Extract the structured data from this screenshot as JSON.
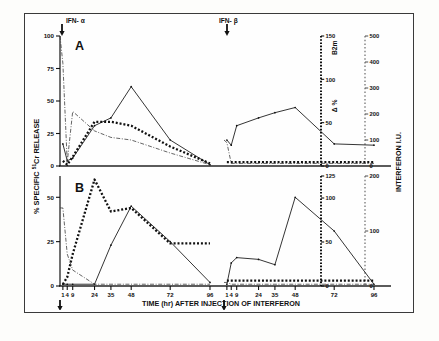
{
  "figure": {
    "axis_x_title": "TIME (hr) AFTER INJECTION OF INTERFERON",
    "axis_y_title_pre": "% SPECIFIC",
    "axis_y_title_sup": "51",
    "axis_y_title_post": "Cr RELEASE",
    "axis_r2_title": "INTERFERON  I.U.",
    "b2m_label_main": "B",
    "b2m_label_sub": "2",
    "b2m_label_tail": "m",
    "delta_label": "Δ %",
    "marker_alpha": "IFN- α",
    "marker_beta": "IFN- β",
    "panel_a_letter": "A",
    "panel_b_letter": "B",
    "zero_left": "0",
    "zero_mid": "0",
    "xticks": [
      "1",
      "4",
      "9",
      "24",
      "35",
      "48",
      "72",
      "96"
    ],
    "panel_a_yticks": [
      "0",
      "25",
      "50",
      "75",
      "100"
    ],
    "panel_b_yticks": [
      "0",
      "25",
      "50"
    ],
    "panel_a_b2m_ticks": [
      "0",
      "50",
      "100",
      "150"
    ],
    "panel_b_b2m_ticks": [
      "0",
      "50",
      "100",
      "125"
    ],
    "panel_a_ifn_ticks": [
      "0",
      "100",
      "200",
      "300",
      "400",
      "500"
    ],
    "panel_b_ifn_ticks": [
      "0",
      "100",
      "200"
    ],
    "colors": {
      "ink": "#111111",
      "frame": "#3a3a3a",
      "grey": "#5b5b5b",
      "paper": "#fefefe"
    }
  },
  "chart_data": {
    "type": "line",
    "xlabel": "TIME (hr) AFTER INJECTION OF INTERFERON",
    "ylabel": "% SPECIFIC 51Cr RELEASE",
    "y2label": "Δ % B2m",
    "y3label": "INTERFERON I.U.",
    "grid": false,
    "legend": "none",
    "x_tick_values": [
      1,
      4,
      9,
      24,
      35,
      48,
      72,
      96
    ],
    "segments": [
      "IFN-alpha injection at 0 hr",
      "IFN-beta injection at 0 hr"
    ],
    "panels": [
      {
        "panel": "A",
        "ylim": [
          0,
          100
        ],
        "y_ticks": [
          0,
          25,
          50,
          75,
          100
        ],
        "y2lim": [
          0,
          150
        ],
        "y2_ticks": [
          0,
          50,
          100,
          150
        ],
        "y3lim": [
          0,
          500
        ],
        "y3_ticks": [
          0,
          100,
          200,
          300,
          400,
          500
        ],
        "series": [
          {
            "name": "cytotoxicity (solid)",
            "style": "solid",
            "half": "alpha",
            "x": [
              1,
              4,
              9,
              24,
              35,
              48,
              72,
              96
            ],
            "y": [
              17,
              4,
              6,
              31,
              37,
              61,
              20,
              1
            ]
          },
          {
            "name": "B2m delta % (thick dotted)",
            "style": "dotted-thick",
            "half": "alpha",
            "x": [
              1,
              4,
              9,
              24,
              35,
              48,
              72,
              96
            ],
            "y": [
              4,
              1,
              7,
              34,
              34,
              31,
              15,
              2
            ]
          },
          {
            "name": "interferon I.U. (dash-dot)",
            "style": "dash-dot",
            "half": "alpha",
            "x": [
              0,
              1,
              4,
              9,
              24,
              35,
              48,
              72,
              96
            ],
            "y": [
              100,
              79,
              3,
              42,
              27,
              22,
              20,
              10,
              1
            ]
          },
          {
            "name": "cytotoxicity (solid)",
            "style": "solid",
            "half": "beta",
            "x": [
              1,
              4,
              9,
              24,
              35,
              48,
              72,
              96
            ],
            "y": [
              20,
              16,
              31,
              37,
              41,
              45,
              17,
              16
            ]
          },
          {
            "name": "B2m delta % (thick dotted)",
            "style": "dotted-thick",
            "half": "beta",
            "x": [
              1,
              4,
              9,
              24,
              35,
              48,
              72,
              96
            ],
            "y": [
              3,
              3,
              3,
              3,
              3,
              3,
              3,
              3
            ]
          },
          {
            "name": "interferon I.U. (dash-dot)",
            "style": "dash-dot",
            "half": "beta",
            "x": [
              0,
              1,
              4,
              9,
              24,
              35,
              48,
              72,
              96
            ],
            "y": [
              20,
              18,
              2,
              2,
              2,
              2,
              2,
              2,
              2
            ]
          }
        ]
      },
      {
        "panel": "B",
        "ylim": [
          0,
          62
        ],
        "y_ticks": [
          0,
          25,
          50
        ],
        "y2lim": [
          0,
          125
        ],
        "y2_ticks": [
          0,
          50,
          100,
          125
        ],
        "y3lim": [
          0,
          200
        ],
        "y3_ticks": [
          0,
          100,
          200
        ],
        "series": [
          {
            "name": "cytotoxicity (solid)",
            "style": "solid",
            "half": "alpha",
            "x": [
              1,
              4,
              9,
              24,
              35,
              48,
              72,
              96
            ],
            "y": [
              1,
              1,
              1,
              1,
              23,
              45,
              25,
              2
            ]
          },
          {
            "name": "B2m delta % (thick dotted)",
            "style": "dotted-thick",
            "half": "alpha",
            "x": [
              1,
              4,
              9,
              24,
              35,
              48,
              72,
              96
            ],
            "y": [
              1,
              5,
              18,
              60,
              42,
              44,
              24,
              24
            ]
          },
          {
            "name": "interferon I.U. (dash-dot)",
            "style": "dash-dot",
            "half": "alpha",
            "x": [
              0,
              1,
              4,
              9,
              24,
              35,
              48,
              72,
              96
            ],
            "y": [
              44,
              44,
              18,
              9,
              1,
              1,
              1,
              1,
              1
            ]
          },
          {
            "name": "cytotoxicity (solid)",
            "style": "solid",
            "half": "beta",
            "x": [
              1,
              4,
              9,
              24,
              35,
              48,
              72,
              96
            ],
            "y": [
              1,
              13,
              16,
              15,
              12,
              50,
              31,
              1
            ]
          },
          {
            "name": "B2m delta % (thick dotted)",
            "style": "dotted-thick",
            "half": "beta",
            "x": [
              1,
              4,
              9,
              24,
              35,
              48,
              72,
              96
            ],
            "y": [
              3,
              3,
              3,
              3,
              3,
              3,
              3,
              3
            ]
          },
          {
            "name": "interferon I.U. (dash-dot)",
            "style": "dash-dot",
            "half": "beta",
            "x": [
              0,
              1,
              4,
              9,
              24,
              35,
              48,
              72,
              96
            ],
            "y": [
              2,
              2,
              1,
              1,
              1,
              1,
              1,
              1,
              1
            ]
          }
        ]
      }
    ]
  }
}
